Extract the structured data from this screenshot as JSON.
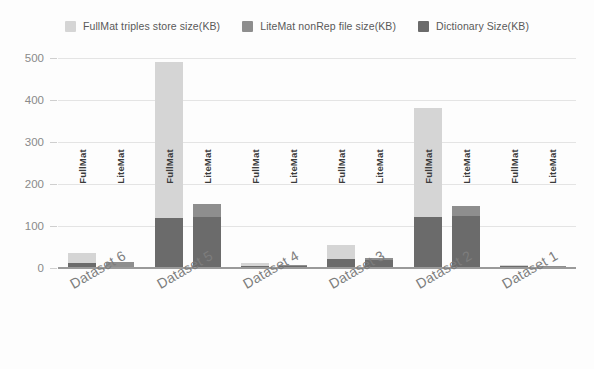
{
  "chart_data": {
    "type": "bar",
    "title": "",
    "subtitle": "",
    "xlabel": "",
    "ylabel": "",
    "ylim": [
      0,
      500
    ],
    "yticks": [
      0,
      100,
      200,
      300,
      400,
      500
    ],
    "grid": true,
    "stacked": true,
    "legend_position": "top-center",
    "categories": [
      "Dataset 6",
      "Dataset 5",
      "Dataset 4",
      "Dataset 3",
      "Dataset 2",
      "Dataset 1"
    ],
    "bar_labels": [
      "FullMat",
      "LiteMat"
    ],
    "series": [
      {
        "name": "FullMat triples store size(KB)",
        "color": "#d5d5d5",
        "applies_to": "FullMat",
        "values": [
          24,
          370,
          7,
          33,
          258,
          4
        ]
      },
      {
        "name": "LiteMat nonRep file size(KB)",
        "color": "#8e8e8e",
        "applies_to": "LiteMat",
        "values": [
          12,
          30,
          3,
          5,
          25,
          3
        ]
      },
      {
        "name": "Dictionary Size(KB)",
        "color": "#6b6b6b",
        "applies_to": "both",
        "values_fullmat": [
          12,
          120,
          5,
          22,
          122,
          4
        ],
        "values_litemat": [
          3,
          122,
          4,
          20,
          123,
          3
        ]
      }
    ],
    "bar_totals": {
      "FullMat": [
        36,
        490,
        12,
        55,
        380,
        8
      ],
      "LiteMat": [
        15,
        152,
        7,
        25,
        148,
        6
      ]
    }
  },
  "legend": {
    "items": [
      {
        "label": "FullMat triples store size(KB)",
        "color": "#d5d5d5",
        "icon": "square-swatch-icon"
      },
      {
        "label": "LiteMat nonRep file size(KB)",
        "color": "#8e8e8e",
        "icon": "square-swatch-icon"
      },
      {
        "label": "Dictionary Size(KB)",
        "color": "#6b6b6b",
        "icon": "square-swatch-icon"
      }
    ]
  },
  "axes": {
    "y_tick_labels": [
      "500",
      "400",
      "300",
      "200",
      "100",
      "0"
    ],
    "x_tick_labels": [
      "Dataset 6",
      "Dataset 5",
      "Dataset 4",
      "Dataset 3",
      "Dataset 2",
      "Dataset 1"
    ]
  },
  "bar_inline_labels": [
    "FullMat",
    "LiteMat",
    "FullMat",
    "LiteMat",
    "FullMat",
    "LiteMat",
    "FullMat",
    "LiteMat",
    "FullMat",
    "LiteMat",
    "FullMat",
    "LiteMat"
  ],
  "colors": {
    "background": "#fdfdfd",
    "grid": "#e4e4e4",
    "axis": "#9a9a9a",
    "tick_text": "#8a8a8a",
    "legend_text": "#595959",
    "xlabel_text": "#7d7d7d",
    "series_light": "#d5d5d5",
    "series_medium": "#8e8e8e",
    "series_dark": "#6b6b6b"
  }
}
